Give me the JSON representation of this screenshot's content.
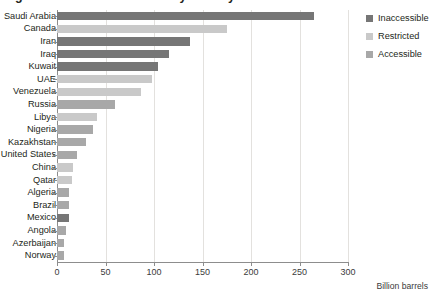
{
  "chart_data": {
    "type": "bar",
    "orientation": "horizontal",
    "title": "Figure 2. Global oil reserves by country",
    "xlabel": "Billion barrels",
    "ylabel": "",
    "xlim": [
      0,
      300
    ],
    "xticks": [
      0,
      50,
      100,
      150,
      200,
      250,
      300
    ],
    "grid": true,
    "grid_axis": "x",
    "legend_position": "right",
    "categories": [
      "Saudi Arabia",
      "Canada",
      "Iran",
      "Iraq",
      "Kuwait",
      "UAE",
      "Venezuela",
      "Russia",
      "Libya",
      "Nigeria",
      "Kazakhstan",
      "United States",
      "China",
      "Qatar",
      "Algeria",
      "Brazil",
      "Mexico",
      "Angola",
      "Azerbaijan",
      "Norway"
    ],
    "values": [
      265,
      175,
      137,
      115,
      104,
      98,
      87,
      60,
      41,
      37,
      30,
      21,
      16,
      15,
      12,
      12,
      12,
      9,
      7,
      7
    ],
    "access_category": [
      "Inaccessible",
      "Restricted",
      "Inaccessible",
      "Inaccessible",
      "Inaccessible",
      "Restricted",
      "Restricted",
      "Accessible",
      "Restricted",
      "Accessible",
      "Accessible",
      "Accessible",
      "Restricted",
      "Restricted",
      "Accessible",
      "Accessible",
      "Inaccessible",
      "Accessible",
      "Accessible",
      "Accessible"
    ],
    "series": [
      {
        "name": "Inaccessible",
        "color": "#767676"
      },
      {
        "name": "Restricted",
        "color": "#c9c9c9"
      },
      {
        "name": "Accessible",
        "color": "#a8a8a8"
      }
    ]
  },
  "legend": {
    "items": [
      {
        "label": "Inaccessible",
        "color": "#767676"
      },
      {
        "label": "Restricted",
        "color": "#c9c9c9"
      },
      {
        "label": "Accessible",
        "color": "#a8a8a8"
      }
    ]
  },
  "axis": {
    "x_title": "Billion barrels"
  },
  "colors": {
    "inaccessible": "#767676",
    "restricted": "#c9c9c9",
    "accessible": "#a8a8a8",
    "grid": "#e3e1de",
    "axis": "#8d8d8d",
    "text": "#231f20"
  }
}
